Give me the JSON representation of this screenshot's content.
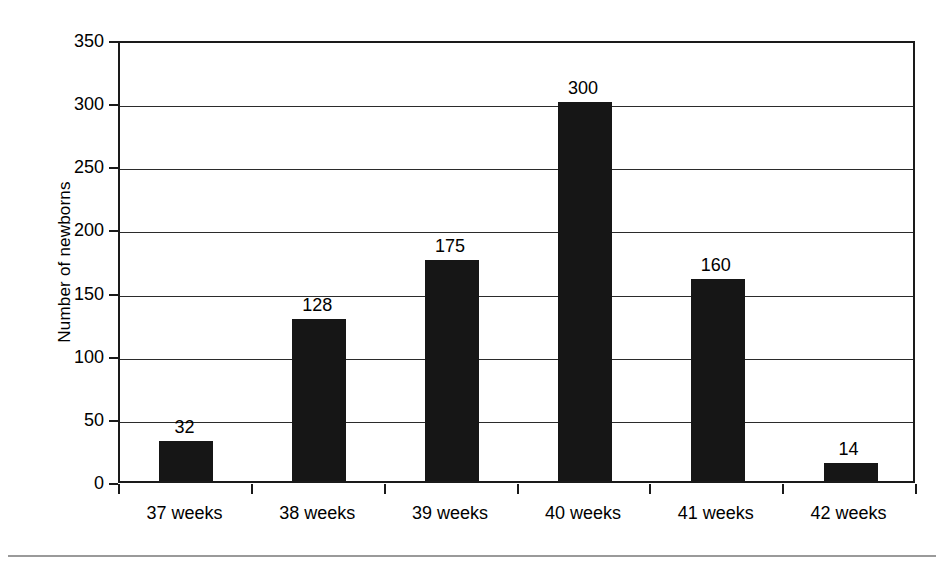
{
  "chart_data": {
    "type": "bar",
    "title": "",
    "xlabel": "",
    "ylabel": "Number of newborns",
    "categories": [
      "37 weeks",
      "38 weeks",
      "39 weeks",
      "40 weeks",
      "41 weeks",
      "42 weeks"
    ],
    "values": [
      32,
      128,
      175,
      300,
      160,
      14
    ],
    "value_labels": [
      "32",
      "128",
      "175",
      "300",
      "160",
      "14"
    ],
    "ylim": [
      0,
      350
    ],
    "yticks": [
      0,
      50,
      100,
      150,
      200,
      250,
      300,
      350
    ],
    "ytick_labels": [
      "0",
      "50",
      "100",
      "150",
      "200",
      "250",
      "300",
      "350"
    ],
    "grid": true,
    "legend": false,
    "bar_color": "#161616",
    "axis_color": "#1a1a1a",
    "background": "#ffffff",
    "rule_color": "#9a9a9a"
  }
}
